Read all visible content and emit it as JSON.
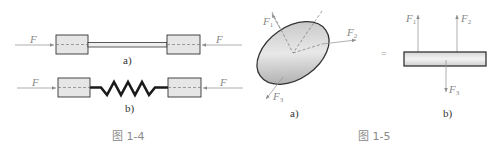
{
  "figure_1_4": {
    "caption": "图 1-4",
    "part_a": {
      "label": "a)",
      "left_force": "F",
      "right_force": "F",
      "connector": "rod"
    },
    "part_b": {
      "label": "b)",
      "left_force": "F",
      "right_force": "F",
      "connector": "spring"
    }
  },
  "figure_1_5": {
    "caption": "图 1-5",
    "equals_sign": "=",
    "part_a": {
      "label": "a)",
      "forces": [
        {
          "name": "F",
          "sub": "1"
        },
        {
          "name": "F",
          "sub": "2"
        },
        {
          "name": "F",
          "sub": "3"
        }
      ]
    },
    "part_b": {
      "label": "b)",
      "forces": [
        {
          "name": "F",
          "sub": "1"
        },
        {
          "name": "F",
          "sub": "2"
        },
        {
          "name": "F",
          "sub": "3"
        }
      ]
    }
  },
  "colors": {
    "block_fill": "#e6e6e6",
    "outline": "#333333",
    "force_line": "#9a9a9a",
    "caption": "#8a8a8a"
  }
}
